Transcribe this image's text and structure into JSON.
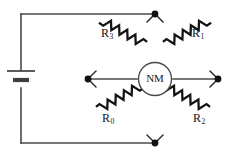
{
  "figure": {
    "name": "wheatstone-bridge-circuit",
    "background_color": "#ffffff",
    "wire_color": "#4a4a4a",
    "resistor_color": "#141414",
    "node_color": "#111111"
  },
  "meter": {
    "label": "NM",
    "shape": "circle"
  },
  "battery": {
    "orientation": "vertical",
    "long_plate": "positive",
    "short_plate": "negative"
  },
  "resistors": [
    {
      "id": "r3",
      "letter": "R",
      "subscript": "3",
      "position": "top-left"
    },
    {
      "id": "r1",
      "letter": "R",
      "subscript": "1",
      "position": "top-right"
    },
    {
      "id": "r0",
      "letter": "R",
      "subscript": "0",
      "position": "bottom-left"
    },
    {
      "id": "r2",
      "letter": "R",
      "subscript": "2",
      "position": "bottom-right"
    }
  ],
  "nodes": [
    {
      "id": "top",
      "x": 155,
      "y": 14
    },
    {
      "id": "left",
      "x": 88,
      "y": 79
    },
    {
      "id": "right",
      "x": 218,
      "y": 79
    },
    {
      "id": "bottom",
      "x": 155,
      "y": 143
    }
  ]
}
